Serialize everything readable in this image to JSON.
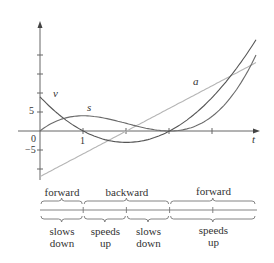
{
  "figure": {
    "curves": {
      "s": {
        "label": "s",
        "formula": "t^3 - 6t^2 + 9t",
        "color": "#6b6b6b"
      },
      "v": {
        "label": "v",
        "formula": "3t^2 - 12t + 9",
        "color": "#555555"
      },
      "a": {
        "label": "a",
        "formula": "6t - 12",
        "color": "#b5b5b5"
      }
    },
    "axes": {
      "x_label": "t",
      "origin_label": "0",
      "x_tick_label": "1",
      "y_tick_pos_label": "5",
      "y_tick_neg_label": "−5"
    },
    "direction": [
      {
        "label": "forward",
        "t_start": 0,
        "t_end": 1
      },
      {
        "label": "backward",
        "t_start": 1,
        "t_end": 3
      },
      {
        "label": "forward",
        "t_start": 3,
        "t_end": 5
      }
    ],
    "speed": [
      {
        "line1": "slows",
        "line2": "down",
        "t_start": 0,
        "t_end": 1
      },
      {
        "line1": "speeds",
        "line2": "up",
        "t_start": 1,
        "t_end": 2
      },
      {
        "line1": "slows",
        "line2": "down",
        "t_start": 2,
        "t_end": 3
      },
      {
        "line1": "speeds",
        "line2": "up",
        "t_start": 3,
        "t_end": 5
      }
    ]
  }
}
